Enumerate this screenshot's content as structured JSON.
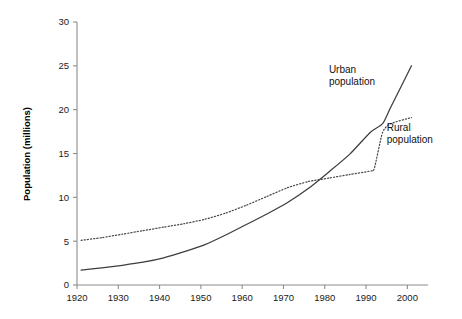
{
  "chart_data": {
    "type": "line",
    "title": "",
    "xlabel": "",
    "ylabel": "Population (millions)",
    "xlim": [
      1920,
      2005
    ],
    "ylim": [
      0,
      30
    ],
    "grid": false,
    "legend_position": "inline-annotations",
    "xticks": [
      1920,
      1930,
      1940,
      1950,
      1960,
      1970,
      1980,
      1990,
      2000
    ],
    "xtick_labels": [
      "1920",
      "1930",
      "1940",
      "1950",
      "1960",
      "1970",
      "1980",
      "1990",
      "2000"
    ],
    "yticks": [
      0,
      5,
      10,
      15,
      20,
      25,
      30
    ],
    "ytick_labels": [
      "0",
      "5",
      "10",
      "15",
      "20",
      "25",
      "30"
    ],
    "annotations": [
      {
        "name": "urban-label",
        "text_line1": "Urban",
        "text_line2": "population",
        "x": 1981,
        "y": 24.2
      },
      {
        "name": "rural-label",
        "text_line1": "Rural",
        "text_line2": "population",
        "x": 1995,
        "y": 17.6
      }
    ],
    "series": [
      {
        "name": "Urban population",
        "style": "solid",
        "x": [
          1921,
          1926,
          1931,
          1936,
          1941,
          1946,
          1951,
          1956,
          1961,
          1966,
          1971,
          1976,
          1981,
          1986,
          1991,
          1994,
          1996,
          2001
        ],
        "values": [
          1.7,
          1.95,
          2.25,
          2.6,
          3.1,
          3.8,
          4.6,
          5.7,
          6.9,
          8.1,
          9.4,
          11.0,
          12.9,
          14.9,
          17.4,
          18.4,
          20.3,
          25.0
        ]
      },
      {
        "name": "Rural population",
        "style": "dotted",
        "x": [
          1921,
          1926,
          1931,
          1936,
          1941,
          1946,
          1951,
          1956,
          1961,
          1966,
          1971,
          1976,
          1981,
          1986,
          1991,
          1992,
          1994,
          1996,
          2001
        ],
        "values": [
          5.1,
          5.4,
          5.8,
          6.2,
          6.6,
          7.0,
          7.5,
          8.2,
          9.1,
          10.1,
          11.1,
          11.8,
          12.2,
          12.6,
          13.0,
          13.3,
          17.4,
          18.4,
          19.1
        ]
      }
    ]
  },
  "axis_title": {
    "y": "Population (millions)"
  }
}
